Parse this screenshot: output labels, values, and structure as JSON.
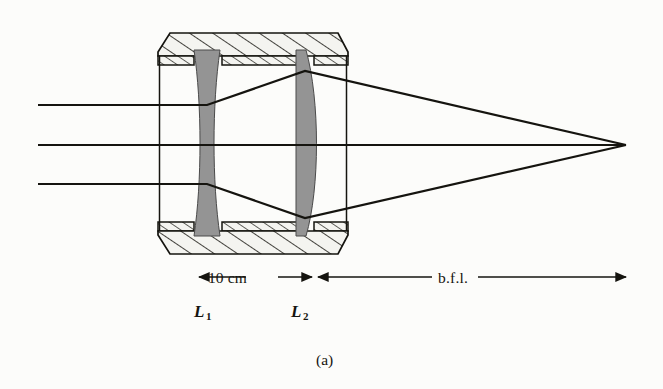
{
  "figure": {
    "caption": "(a)",
    "background_color": "#fcfcfa",
    "ink_color": "#15140f",
    "glass_fill_color": "#949494",
    "housing_fill_color": "#f2f2ee",
    "type": "optical-ray-diagram"
  },
  "labels": {
    "separation": "10 cm",
    "back_focal_length": "b.f.l.",
    "lens_1_letter": "L",
    "lens_1_subscript": "1",
    "lens_2_letter": "L",
    "lens_2_subscript": "2"
  },
  "optics": {
    "lenses": [
      {
        "name": "L1",
        "kind": "biconcave",
        "role": "diverging",
        "center_x": 207,
        "top_y": 50,
        "bottom_y": 236,
        "edge_thickness": 26,
        "center_thickness": 11
      },
      {
        "name": "L2",
        "kind": "plano-convex",
        "role": "converging",
        "center_x": 305,
        "top_y": 50,
        "bottom_y": 236,
        "flat_side": "left",
        "convex_side": "right",
        "edge_thickness": 10,
        "center_thickness": 22
      }
    ],
    "separation_label": "10 cm",
    "focal_point": {
      "x": 626,
      "y": 145
    },
    "incoming_rays": [
      {
        "id": "ray-upper",
        "y": 105,
        "start_x": 38
      },
      {
        "id": "ray-axis",
        "y": 145,
        "start_x": 38
      },
      {
        "id": "ray-lower",
        "y": 184,
        "start_x": 38
      }
    ],
    "ray_heights_at_l2": [
      71,
      145,
      218
    ]
  },
  "housing": {
    "left_x": 158,
    "right_x": 348,
    "top_outer_y": 33,
    "top_inner_y": 63,
    "bottom_inner_y": 223,
    "bottom_outer_y": 253,
    "hatch_style": "diagonal"
  },
  "dimensions": {
    "baseline_y": 277,
    "separation_arrow": {
      "from_x": 199,
      "to_x": 312
    },
    "bfl_arrow": {
      "from_x": 318,
      "to_x": 626
    }
  }
}
